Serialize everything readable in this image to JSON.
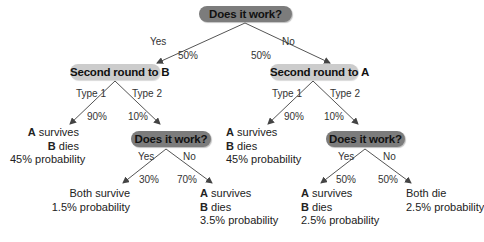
{
  "colors": {
    "decision_pill": "#7c7c7c",
    "round_pill": "#cccccc",
    "line": "#555555"
  },
  "root": {
    "label": "Does it work?",
    "yes": {
      "label": "Yes",
      "prob": "50%"
    },
    "no": {
      "label": "No",
      "prob": "50%"
    }
  },
  "left_branch": {
    "label": "Second round to B",
    "type1": {
      "label": "Type 1",
      "prob": "90%"
    },
    "type2": {
      "label": "Type 2",
      "prob": "10%"
    },
    "outcome_type1": {
      "a": "A",
      "a_rest": " survives",
      "b": "B",
      "b_rest": " dies",
      "prob": "45% probability"
    },
    "decision": {
      "label": "Does it work?",
      "yes": {
        "label": "Yes",
        "prob": "30%"
      },
      "no": {
        "label": "No",
        "prob": "70%"
      },
      "outcome_yes": {
        "line1": "Both survive",
        "prob": "1.5% probability"
      },
      "outcome_no": {
        "a": "A",
        "a_rest": " survives",
        "b": "B",
        "b_rest": " dies",
        "prob": "3.5% probability"
      }
    }
  },
  "right_branch": {
    "label": "Second round to A",
    "type1": {
      "label": "Type 1",
      "prob": "90%"
    },
    "type2": {
      "label": "Type 2",
      "prob": "10%"
    },
    "outcome_type1": {
      "a": "A",
      "a_rest": " survives",
      "b": "B",
      "b_rest": " dies",
      "prob": "45% probability"
    },
    "decision": {
      "label": "Does it work?",
      "yes": {
        "label": "Yes",
        "prob": "50%"
      },
      "no": {
        "label": "No",
        "prob": "50%"
      },
      "outcome_yes": {
        "a": "A",
        "a_rest": " survives",
        "b": "B",
        "b_rest": " dies",
        "prob": "2.5% probability"
      },
      "outcome_no": {
        "line1": "Both die",
        "prob": "2.5% probability"
      }
    }
  }
}
